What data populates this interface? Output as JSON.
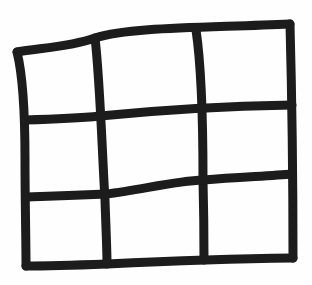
{
  "diagram": {
    "rows": 3,
    "columns": 3,
    "stroke_color": "#1c1c1c",
    "background_color": "#fefefe",
    "stroke_width": 9
  }
}
